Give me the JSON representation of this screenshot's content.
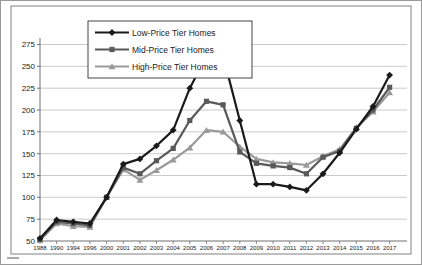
{
  "chart_data": {
    "type": "line",
    "title": "",
    "xlabel": "",
    "ylabel": "",
    "x_labels": [
      "1988",
      "1990",
      "1994",
      "1996",
      "2000",
      "2001",
      "2002",
      "2003",
      "2004",
      "2005",
      "2006",
      "2007",
      "2008",
      "2009",
      "2010",
      "2011",
      "2012",
      "2013",
      "2014",
      "2015",
      "2016",
      "2017"
    ],
    "y_ticks": [
      50,
      75,
      100,
      125,
      150,
      175,
      200,
      225,
      250,
      275
    ],
    "ylim": [
      50,
      275
    ],
    "grid": "horizontal",
    "legend_position": "top-left-inset",
    "series": [
      {
        "name": "Low-Price Tier Homes",
        "color": "#1a1a1a",
        "marker": "diamond",
        "values": [
          53,
          74,
          72,
          70,
          100,
          138,
          144,
          159,
          177,
          225,
          262,
          262,
          188,
          115,
          115,
          112,
          108,
          127,
          151,
          178,
          204,
          240
        ]
      },
      {
        "name": "Mid-Price Tier Homes",
        "color": "#595959",
        "marker": "square",
        "values": [
          52,
          72,
          70,
          68,
          100,
          134,
          127,
          142,
          156,
          188,
          210,
          206,
          152,
          139,
          136,
          134,
          127,
          146,
          153,
          179,
          200,
          226
        ]
      },
      {
        "name": "High-Price Tier Homes",
        "color": "#9a9a9a",
        "marker": "triangle",
        "values": [
          51,
          70,
          67,
          66,
          100,
          132,
          120,
          131,
          143,
          157,
          177,
          175,
          158,
          144,
          140,
          139,
          137,
          147,
          155,
          180,
          198,
          220
        ]
      }
    ]
  }
}
